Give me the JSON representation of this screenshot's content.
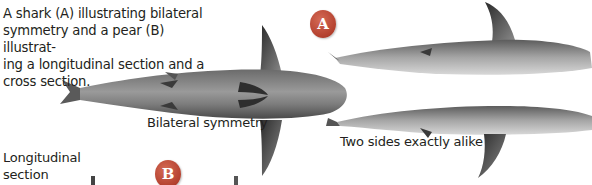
{
  "caption": "A shark (A) illustrating bilateral symmetry and a pear (B) illustrating a longitudinal section and a cross section.",
  "caption_lines": [
    "A shark (A) illustrating bilateral",
    "symmetry and a pear (B) illustrat-",
    "ing a longitudinal section and a",
    "cross section."
  ],
  "badges": {
    "a": "A",
    "b": "B"
  },
  "labels": {
    "bilateral": "Bilateral symmetry",
    "two_sides": "Two sides exactly alike",
    "longitudinal_1": "Longitudinal",
    "longitudinal_2": "section"
  },
  "colors": {
    "badge": "#b3402e",
    "text": "#231f20"
  }
}
